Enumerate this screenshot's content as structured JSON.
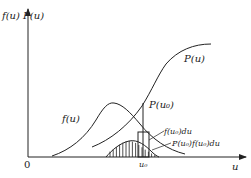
{
  "figure": {
    "axis_labels": {
      "y_axis": "f(u) P(u)",
      "x_axis": "u",
      "origin": "0",
      "u0_tick": "u₀"
    },
    "curve_labels": {
      "cdf": "P(u)",
      "pdf": "f(u)",
      "cdf_at_u0": "P(u₀)",
      "pdf_strip": "f(u₀)du",
      "product": "P(u₀)f(u₀)du"
    },
    "colors": {
      "line": "#222222",
      "background": "#ffffff"
    }
  }
}
